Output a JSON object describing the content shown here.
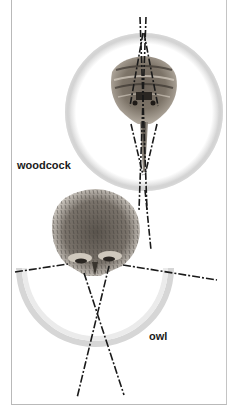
{
  "figure": {
    "labels": {
      "woodcock": "woodcock",
      "owl": "owl"
    },
    "colors": {
      "ring": "#cfcfcf",
      "ring_dark": "#a8a8a8",
      "sightline": "#1a1a1a",
      "frame": "#b9b9b9",
      "feather_dark": "#4a4540",
      "feather_mid": "#8a8279",
      "feather_light": "#c9c2b8"
    }
  }
}
